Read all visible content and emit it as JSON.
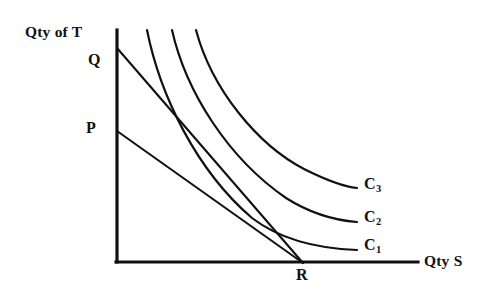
{
  "figure": {
    "kind": "indifference-curve-budget-line-diagram",
    "background_color": "#ffffff",
    "ink_color": "#111111"
  },
  "axes": {
    "y_title": "Qty of T",
    "x_title": "Qty S",
    "origin_label": "",
    "y_axis": {
      "x": 117,
      "y_top": 30,
      "y_bottom": 262
    },
    "x_axis": {
      "y": 262,
      "x_left": 117,
      "x_right": 418
    }
  },
  "points": [
    {
      "id": "Q",
      "label": "Q",
      "axis": "y",
      "x": 117,
      "y": 48
    },
    {
      "id": "P",
      "label": "P",
      "axis": "y",
      "x": 117,
      "y": 131
    },
    {
      "id": "R",
      "label": "R",
      "axis": "x",
      "x": 302,
      "y": 262
    }
  ],
  "budget_lines": [
    {
      "id": "line-QR",
      "name": "budget-line-q-r",
      "from": "Q",
      "to": "R",
      "x1": 117,
      "y1": 48,
      "x2": 303,
      "y2": 263
    },
    {
      "id": "line-PR",
      "name": "budget-line-p-r",
      "from": "P",
      "to": "R",
      "x1": 117,
      "y1": 131,
      "x2": 303,
      "y2": 263
    }
  ],
  "curves": [
    {
      "id": "C1",
      "label": "C",
      "subscript": "1",
      "path": "M 147 30 C 160 95, 196 170, 252 218 C 286 244, 330 249, 357 250",
      "label_x": 364,
      "label_y": 237
    },
    {
      "id": "C2",
      "label": "C",
      "subscript": "2",
      "path": "M 172 30 C 186 92, 228 158, 286 198 C 316 217, 344 221, 357 222",
      "label_x": 364,
      "label_y": 209
    },
    {
      "id": "C3",
      "label": "C",
      "subscript": "3",
      "path": "M 196 30 C 212 90, 258 145, 304 169 C 330 182, 346 187, 357 188",
      "label_x": 364,
      "label_y": 176
    }
  ],
  "curve_labels": [
    {
      "base": "C",
      "sub": "3"
    },
    {
      "base": "C",
      "sub": "2"
    },
    {
      "base": "C",
      "sub": "1"
    }
  ]
}
